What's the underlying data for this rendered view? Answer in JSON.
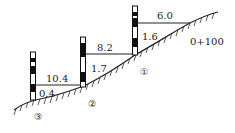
{
  "diagram": {
    "type": "stepped leveling profile (stadia/staff measurement on slope)",
    "station_label": "0+100",
    "stations": [
      {
        "id": "1",
        "marker": "①",
        "horizontal_distance": "6.0",
        "vertical_reading": "1.6"
      },
      {
        "id": "2",
        "marker": "②",
        "horizontal_distance": "8.2",
        "vertical_reading": "1.7"
      },
      {
        "id": "3",
        "marker": "③",
        "horizontal_distance": "10.4",
        "vertical_reading": "0.4"
      }
    ],
    "colors": {
      "line": "#222222",
      "staff_dark": "#111111",
      "staff_light": "#ffffff"
    }
  }
}
